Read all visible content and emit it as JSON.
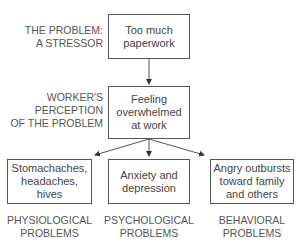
{
  "stressor": {
    "label": "THE PROBLEM:\nA STRESSOR",
    "box_text": "Too much\npaperwork"
  },
  "perception": {
    "label": "WORKER'S\nPERCEPTION\nOF THE PROBLEM",
    "box_text": "Feeling\noverwhelmed\nat work"
  },
  "outcomes": [
    {
      "box_text": "Stomachaches,\nheadaches, hives",
      "label": "PHYSIOLOGICAL\nPROBLEMS"
    },
    {
      "box_text": "Anxiety and\ndepression",
      "label": "PSYCHOLOGICAL\nPROBLEMS"
    },
    {
      "box_text": "Angry outbursts\ntoward family\nand others",
      "label": "BEHAVIORAL\nPROBLEMS"
    }
  ],
  "colors": {
    "line": "#555555",
    "text": "#444444",
    "background": "#ffffff"
  }
}
